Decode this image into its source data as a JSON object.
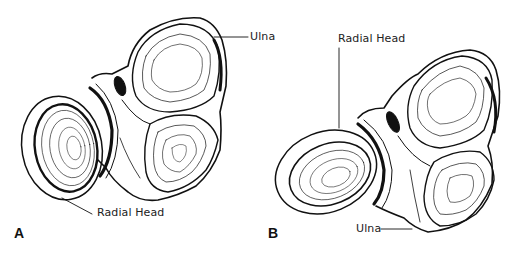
{
  "figure": {
    "panels": [
      {
        "id": "A",
        "label": "A",
        "annotations": [
          {
            "text": "Ulna"
          },
          {
            "text": "Radial Head"
          }
        ]
      },
      {
        "id": "B",
        "label": "B",
        "annotations": [
          {
            "text": "Radial Head"
          },
          {
            "text": "Ulna"
          }
        ]
      }
    ],
    "colors": {
      "ink": "#111111",
      "background": "#ffffff"
    }
  }
}
